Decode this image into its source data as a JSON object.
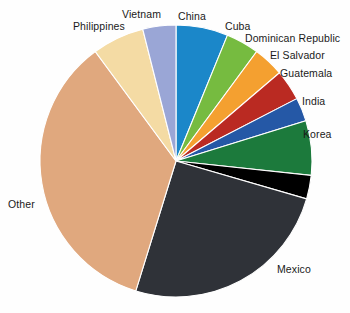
{
  "chart_data": {
    "type": "pie",
    "title": "",
    "subtitle": "",
    "xlabel": "",
    "ylabel": "",
    "grid": false,
    "legend_position": "none",
    "labels_position": "outside-callout",
    "start_angle_deg": 0,
    "direction": "clockwise",
    "categories": [
      "China",
      "Cuba",
      "Dominican Republic",
      "El Salvador",
      "Guatemala",
      "India",
      "Korea",
      "Mexico",
      "Other",
      "Philippines",
      "Vietnam"
    ],
    "values": [
      6.1,
      3.9,
      3.6,
      3.6,
      2.8,
      6.4,
      2.8,
      25.0,
      34.7,
      6.1,
      3.9
    ],
    "value_unit": "percent",
    "slices": [
      {
        "label": "China",
        "percent": 6.1,
        "angle_deg": 22,
        "color": "#1b87c9"
      },
      {
        "label": "Cuba",
        "percent": 3.9,
        "angle_deg": 14,
        "color": "#76bb40"
      },
      {
        "label": "Dominican Republic",
        "percent": 3.6,
        "angle_deg": 13,
        "color": "#f4a030"
      },
      {
        "label": "El Salvador",
        "percent": 3.6,
        "angle_deg": 13,
        "color": "#ba2a22"
      },
      {
        "label": "Guatemala",
        "percent": 2.8,
        "angle_deg": 10,
        "color": "#2558a6"
      },
      {
        "label": "India",
        "percent": 6.4,
        "angle_deg": 23,
        "color": "#1c7a3c"
      },
      {
        "label": "Korea",
        "percent": 2.8,
        "angle_deg": 10,
        "color": "#000000"
      },
      {
        "label": "Mexico",
        "percent": 25.0,
        "angle_deg": 90,
        "color": "#2f3238"
      },
      {
        "label": "Other",
        "percent": 34.7,
        "angle_deg": 125,
        "color": "#e0a87e"
      },
      {
        "label": "Philippines",
        "percent": 6.1,
        "angle_deg": 22,
        "color": "#f4dba4"
      },
      {
        "label": "Vietnam",
        "percent": 3.9,
        "angle_deg": 14,
        "color": "#9aa6d6"
      }
    ]
  },
  "labels": {
    "china": "China",
    "cuba": "Cuba",
    "dominican_republic": "Dominican Republic",
    "el_salvador": "El Salvador",
    "guatemala": "Guatemala",
    "india": "India",
    "korea": "Korea",
    "mexico": "Mexico",
    "other": "Other",
    "philippines": "Philippines",
    "vietnam": "Vietnam"
  },
  "colors": {
    "background": "#fefefe",
    "text": "#1a1a1a",
    "china": "#1b87c9",
    "cuba": "#76bb40",
    "dominican_republic": "#f4a030",
    "el_salvador": "#ba2a22",
    "guatemala": "#2558a6",
    "india": "#1c7a3c",
    "korea": "#000000",
    "mexico": "#2f3238",
    "other": "#e0a87e",
    "philippines": "#f4dba4",
    "vietnam": "#9aa6d6"
  },
  "geometry": {
    "center_x": 176,
    "center_y": 161,
    "radius": 136
  }
}
